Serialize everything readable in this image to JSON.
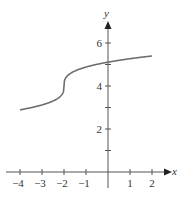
{
  "chart_data": {
    "type": "line",
    "title": "",
    "xlabel": "x",
    "ylabel": "y",
    "xlim": [
      -4.4,
      2.8
    ],
    "ylim": [
      0,
      7
    ],
    "grid": false,
    "legend": null,
    "x_ticks": [
      -4,
      -3,
      -2,
      -1,
      1,
      2
    ],
    "x_tick_labels": [
      "−4",
      "−3",
      "−2",
      "−1",
      "1",
      "2"
    ],
    "y_ticks": [
      1,
      2,
      3,
      4,
      5,
      6
    ],
    "y_tick_labels": [
      "",
      "2",
      "",
      "4",
      "",
      "6"
    ],
    "series": [
      {
        "name": "curve",
        "description": "Cube-root shaped curve with vertical tangent at x = -2, approx y = 4 + 0.88·∛(x+2)",
        "x": [
          -4,
          -3.5,
          -3,
          -2.5,
          -2.2,
          -2.05,
          -2,
          -1.95,
          -1.8,
          -1.5,
          -1,
          -0.5,
          0,
          0.5,
          1,
          1.5,
          2
        ],
        "y": [
          2.85,
          2.98,
          3.1,
          3.3,
          3.48,
          3.68,
          4.0,
          4.32,
          4.52,
          4.7,
          4.88,
          5.0,
          5.12,
          5.18,
          5.24,
          5.28,
          5.32
        ],
        "color": "#6e6e6e"
      }
    ]
  },
  "axes": {
    "x_axis_label": "x",
    "y_axis_label": "y",
    "color": "#555555"
  }
}
